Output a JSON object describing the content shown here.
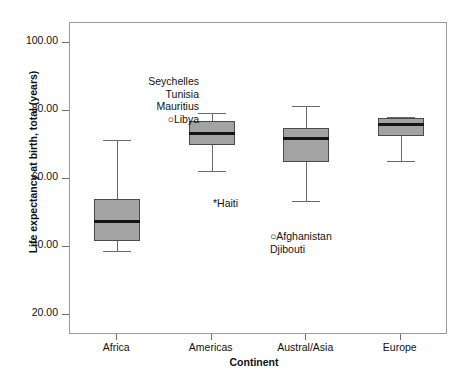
{
  "chart_data": {
    "type": "box",
    "title": "",
    "xlabel": "Continent",
    "ylabel": "Life expectancy at birth, total (years)",
    "ylim": [
      14,
      106
    ],
    "ytick_values": [
      100.0,
      80.0,
      60.0,
      40.0,
      20.0
    ],
    "ytick_labels": [
      "100.00",
      "80.00",
      "60.00",
      "40.00",
      "20.00"
    ],
    "grid": false,
    "legend": "none",
    "categories": [
      "Africa",
      "Americas",
      "Austral/Asia",
      "Europe"
    ],
    "boxes": [
      {
        "category": "Africa",
        "whisker_low": 38.9,
        "q1": 41.8,
        "median": 47.5,
        "q3": 54.0,
        "whisker_high": 71.6
      },
      {
        "category": "Americas",
        "whisker_low": 62.3,
        "q1": 69.9,
        "median": 73.5,
        "q3": 77.0,
        "whisker_high": 79.5
      },
      {
        "category": "Austral/Asia",
        "whisker_low": 53.6,
        "q1": 64.9,
        "median": 71.9,
        "q3": 75.1,
        "whisker_high": 81.6
      },
      {
        "category": "Europe",
        "whisker_low": 65.4,
        "q1": 72.8,
        "median": 76.0,
        "q3": 78.0,
        "whisker_high": 78.4
      }
    ],
    "annotations": [
      {
        "category": "Africa",
        "marker": "circle",
        "align": "right",
        "lines": [
          "Seychelles",
          "Tunisia",
          "Mauritius",
          "Libya"
        ],
        "marker_on_line": 3
      },
      {
        "category": "Americas",
        "marker": "asterisk",
        "align": "left",
        "lines": [
          "Haiti"
        ],
        "marker_on_line": 0
      },
      {
        "category": "Austral/Asia",
        "marker": "circle",
        "align": "left",
        "lines": [
          "Afghanistan",
          "Djibouti"
        ],
        "marker_on_line": 0
      }
    ]
  },
  "style": {
    "box_fill": "#a3a3a3",
    "box_edge": "#4a4a4a",
    "median_color": "#151515",
    "whisker_color": "#6a6a6a",
    "frame_color": "#9a9a9a",
    "text_color": "#111111",
    "background": "#ffffff"
  },
  "markers": {
    "asterisk": "*",
    "circle": "○"
  }
}
